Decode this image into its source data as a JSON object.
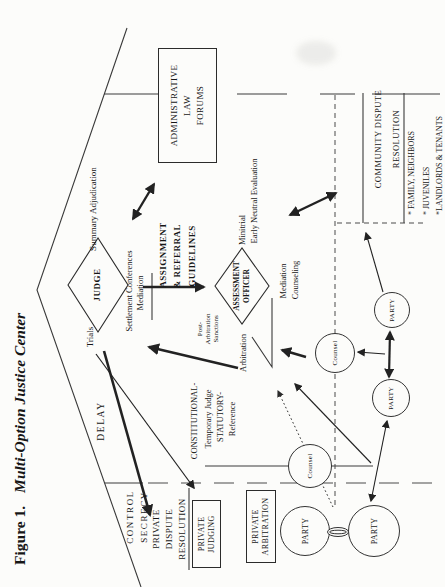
{
  "figure": {
    "number": "Figure 1.",
    "title": "Multi-Option Justice Center"
  },
  "roof": {
    "delay": "DELAY",
    "trials": "Trials",
    "summary_adjudication": "Summary Adjudication"
  },
  "court": {
    "judge": "JUDGE",
    "settlement_conferences": "Settlement Conferences",
    "mediation": "Mediation",
    "assignment_lines": [
      "ASSIGNMENT",
      "& REFERRAL",
      "GUIDELINES"
    ],
    "assessment_lines": [
      "ASSESSMENT",
      "OFFICER"
    ],
    "arbitration": "Arbitration",
    "minitrial": "Minitrial",
    "early_neutral_evaluation": "Early Neutral Evaluation",
    "mediation_below": "Mediation",
    "counseling": "Counseling",
    "post_arbitration_lines": [
      "Post-",
      "Arbitration",
      "Sanctions"
    ]
  },
  "admin_forum": {
    "lines": [
      "ADMINISTRATIVE",
      "LAW",
      "FORUMS"
    ]
  },
  "community": {
    "title_lines": [
      "COMMUNITY DISPUTE",
      "RESOLUTION"
    ],
    "items": [
      "* FAMILY, NEIGHBORS",
      "* JUVENILES",
      "*LANDLORDS & TENANTS"
    ]
  },
  "private": {
    "control": "CONTROL",
    "secrecy": "SECRECY",
    "heading_lines": [
      "PRIVATE",
      "DISPUTE",
      "RESOLUTION"
    ],
    "judging_lines": [
      "PRIVATE",
      "JUDGING"
    ],
    "arbitration_lines": [
      "PRIVATE",
      "ARBITRATION"
    ],
    "constitutional": "CONSTITUTIONAL-",
    "temporary_judge": "Temporary Judge",
    "statutory": "STATUTORY-",
    "reference": "Reference"
  },
  "actors": {
    "party": "PARTY",
    "counsel": "Counsel"
  }
}
